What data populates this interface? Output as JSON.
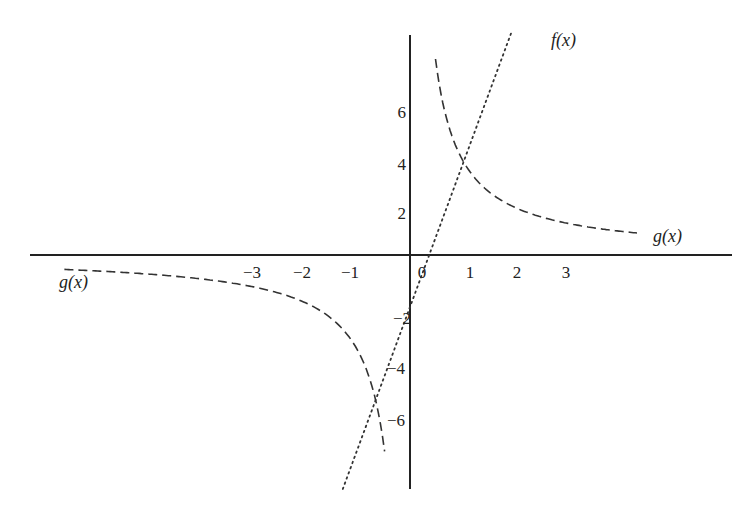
{
  "chart_data": {
    "type": "line",
    "title": "",
    "xlabel": "",
    "ylabel": "",
    "grid": false,
    "legend": "inline labels",
    "xlim": [
      -7.8,
      6.7
    ],
    "ylim": [
      -9.0,
      8.6
    ],
    "x_ticks": [
      -3,
      -2,
      -1,
      0,
      1,
      2,
      3
    ],
    "x_tick_labels": [
      "−3",
      "−2",
      "−1",
      "0",
      "1",
      "2",
      "3"
    ],
    "y_ticks": [
      6,
      4,
      2,
      -2,
      -4,
      -6
    ],
    "y_tick_labels": [
      "6",
      "4",
      "2",
      "−2",
      "−4",
      "−6"
    ],
    "series": [
      {
        "name": "f(x)",
        "style": "dotted",
        "expression": "5x - 2",
        "x": [
          -1.6,
          -1.0,
          -0.717,
          0.0,
          0.4,
          1.0,
          1.117,
          2.0,
          2.45
        ],
        "y": [
          -10.0,
          -7.0,
          -5.58,
          -2.0,
          0.0,
          3.0,
          3.58,
          8.0,
          10.25
        ]
      },
      {
        "name": "g(x)",
        "style": "dashed",
        "expression": "4/x",
        "branches": [
          {
            "x": [
              0.18,
              0.3,
              0.5,
              0.75,
              1.0,
              1.117,
              1.5,
              2.0,
              2.5,
              3.0,
              3.5,
              4.0,
              4.7
            ],
            "y": [
              22.2,
              13.3,
              8.0,
              5.33,
              4.0,
              3.58,
              2.67,
              2.0,
              1.6,
              1.33,
              1.14,
              1.0,
              0.85
            ]
          },
          {
            "x": [
              -7.2,
              -6.0,
              -5.0,
              -4.0,
              -3.0,
              -2.0,
              -1.5,
              -1.0,
              -0.717,
              -0.5,
              -0.25
            ],
            "y": [
              -0.56,
              -0.67,
              -0.8,
              -1.0,
              -1.33,
              -2.0,
              -2.67,
              -4.0,
              -5.58,
              -8.0,
              -16.0
            ]
          }
        ]
      }
    ],
    "annotations": [
      {
        "text": "f(x)",
        "near": "top of dotted line"
      },
      {
        "text": "g(x)",
        "near": "right end of upper dashed branch"
      },
      {
        "text": "g(x)",
        "near": "left end of lower dashed branch"
      }
    ],
    "intersections": [
      {
        "x": 1.117,
        "y": 3.58
      },
      {
        "x": -0.717,
        "y": -5.58
      }
    ]
  },
  "labels": {
    "f": "f(x)",
    "g_right": "g(x)",
    "g_left": "g(x)"
  },
  "colors": {
    "axis": "#222222",
    "curve": "#333333",
    "background": "#ffffff"
  }
}
